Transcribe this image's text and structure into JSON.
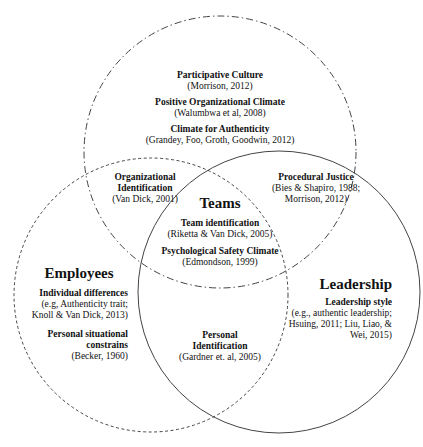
{
  "diagram": {
    "type": "venn",
    "circles": [
      {
        "name": "Organization",
        "line": "dash-dot",
        "cx": 220,
        "cy": 152,
        "r": 136
      },
      {
        "name": "Employees",
        "line": "dashed",
        "cx": 151,
        "cy": 295,
        "r": 137
      },
      {
        "name": "Leadership",
        "line": "solid",
        "cx": 279,
        "cy": 292,
        "r": 141
      }
    ],
    "colors": {
      "stroke": "#444444",
      "text": "#111111",
      "background": "#ffffff"
    }
  },
  "organization": {
    "items": [
      {
        "title": "Participative Culture",
        "cite": "(Morrison, 2012)"
      },
      {
        "title": "Positive Organizational Climate",
        "cite": "(Walumbwa et al, 2008)"
      },
      {
        "title": "Climate for Authenticity",
        "cite": "(Grandey, Foo, Groth, Goodwin, 2012)"
      }
    ]
  },
  "org_employees": {
    "title_1": "Organizational",
    "title_2": "Identification",
    "cite": "(Van Dick, 2001)"
  },
  "org_leadership": {
    "title": "Procedural Justice",
    "cite_1": "(Bies & Shapiro, 1988;",
    "cite_2": "Morrison, 2012)"
  },
  "teams": {
    "heading": "Teams",
    "items": [
      {
        "title": "Team identification",
        "cite": "(Riketta & Van Dick, 2005)"
      },
      {
        "title": "Psychological Safety Climate",
        "cite": "(Edmondson, 1999)"
      }
    ]
  },
  "employees": {
    "heading": "Employees",
    "item1_title": "Individual differences",
    "item1_cite_1": "(e.g, Authenticity trait;",
    "item1_cite_2": "Knoll & Van Dick, 2013)",
    "item2_title_1": "Personal situational",
    "item2_title_2": "constrains",
    "item2_cite": "(Becker, 1960)"
  },
  "leadership": {
    "heading": "Leadership",
    "item_title": "Leadership style",
    "cite_1": "(e.g., authentic leadership;",
    "cite_2": "Hsuing, 2011; Liu, Liao, &",
    "cite_3": "Wei, 2015)"
  },
  "employees_leadership": {
    "title_1": "Personal",
    "title_2": "Identification",
    "cite": "(Gardner et. al, 2005)"
  }
}
